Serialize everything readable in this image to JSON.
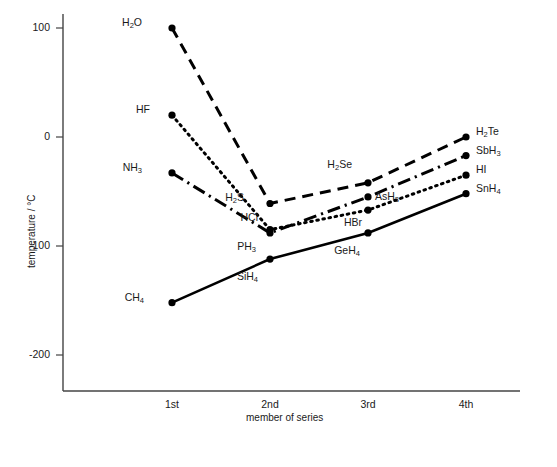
{
  "chart_data": {
    "type": "line",
    "title": "",
    "xlabel": "member of series",
    "ylabel": "temperature / °C",
    "categories": [
      "1st",
      "2nd",
      "3rd",
      "4th"
    ],
    "x": [
      1,
      2,
      3,
      4
    ],
    "ylim": [
      -240,
      120
    ],
    "xlim": [
      0.45,
      4.45
    ],
    "yticks": [
      100,
      0,
      -100,
      -200
    ],
    "ytick_labels": [
      "100",
      "0",
      "-100",
      "-200"
    ],
    "grid": false,
    "legend": "none (points labelled directly)",
    "series": [
      {
        "name": "group 16 hydrides",
        "style": "dashed",
        "point_labels": [
          "H2O",
          "H2S",
          "H2Se",
          "H2Te"
        ],
        "point_labels_html": [
          "H<sub>2</sub>O",
          "H<sub>2</sub>S",
          "H<sub>2</sub>Se",
          "H<sub>2</sub>Te"
        ],
        "values": [
          100,
          -61,
          -42,
          0
        ]
      },
      {
        "name": "group 15 hydrides",
        "style": "dash-dot",
        "point_labels": [
          "NH3",
          "PH3",
          "AsH3",
          "SbH3"
        ],
        "point_labels_html": [
          "NH<sub>3</sub>",
          "PH<sub>3</sub>",
          "AsH<sub>3</sub>",
          "SbH<sub>3</sub>"
        ],
        "values": [
          -33,
          -88,
          -55,
          -17
        ]
      },
      {
        "name": "group 17 hydrides",
        "style": "dotted",
        "point_labels": [
          "HF",
          "HCl",
          "HBr",
          "HI"
        ],
        "point_labels_html": [
          "HF",
          "HCl",
          "HBr",
          "HI"
        ],
        "values": [
          20,
          -85,
          -67,
          -35
        ]
      },
      {
        "name": "group 14 hydrides",
        "style": "solid",
        "point_labels": [
          "CH4",
          "SiH4",
          "GeH4",
          "SnH4"
        ],
        "point_labels_html": [
          "CH<sub>4</sub>",
          "SiH<sub>4</sub>",
          "GeH<sub>4</sub>",
          "SnH<sub>4</sub>"
        ],
        "values": [
          -152,
          -112,
          -88,
          -52
        ]
      }
    ],
    "label_offsets": [
      {
        "label": "H2O",
        "dx": -30,
        "dy": -5
      },
      {
        "label": "H2S",
        "dx": -26,
        "dy": -5
      },
      {
        "label": "H2Se",
        "dx": -16,
        "dy": -18
      },
      {
        "label": "H2Te",
        "dx": 10,
        "dy": -5
      },
      {
        "label": "NH3",
        "dx": -30,
        "dy": -5
      },
      {
        "label": "PH3",
        "dx": -14,
        "dy": 14
      },
      {
        "label": "AsH3",
        "dx": 7,
        "dy": 0
      },
      {
        "label": "SbH3",
        "dx": 10,
        "dy": -5
      },
      {
        "label": "HF",
        "dx": -22,
        "dy": -5
      },
      {
        "label": "HCl",
        "dx": -12,
        "dy": -12
      },
      {
        "label": "HBr",
        "dx": -6,
        "dy": 13
      },
      {
        "label": "HI",
        "dx": 10,
        "dy": -5
      },
      {
        "label": "CH4",
        "dx": -28,
        "dy": -5
      },
      {
        "label": "SiH4",
        "dx": -12,
        "dy": 18
      },
      {
        "label": "GeH4",
        "dx": -8,
        "dy": 18
      },
      {
        "label": "SnH4",
        "dx": 10,
        "dy": -5
      }
    ]
  },
  "axes": {
    "y_title": "temperature / °C",
    "x_title": "member of series",
    "y_tick_labels": [
      "100",
      "0",
      "-100",
      "-200"
    ],
    "x_tick_labels": [
      "1st",
      "2nd",
      "3rd",
      "4th"
    ]
  }
}
